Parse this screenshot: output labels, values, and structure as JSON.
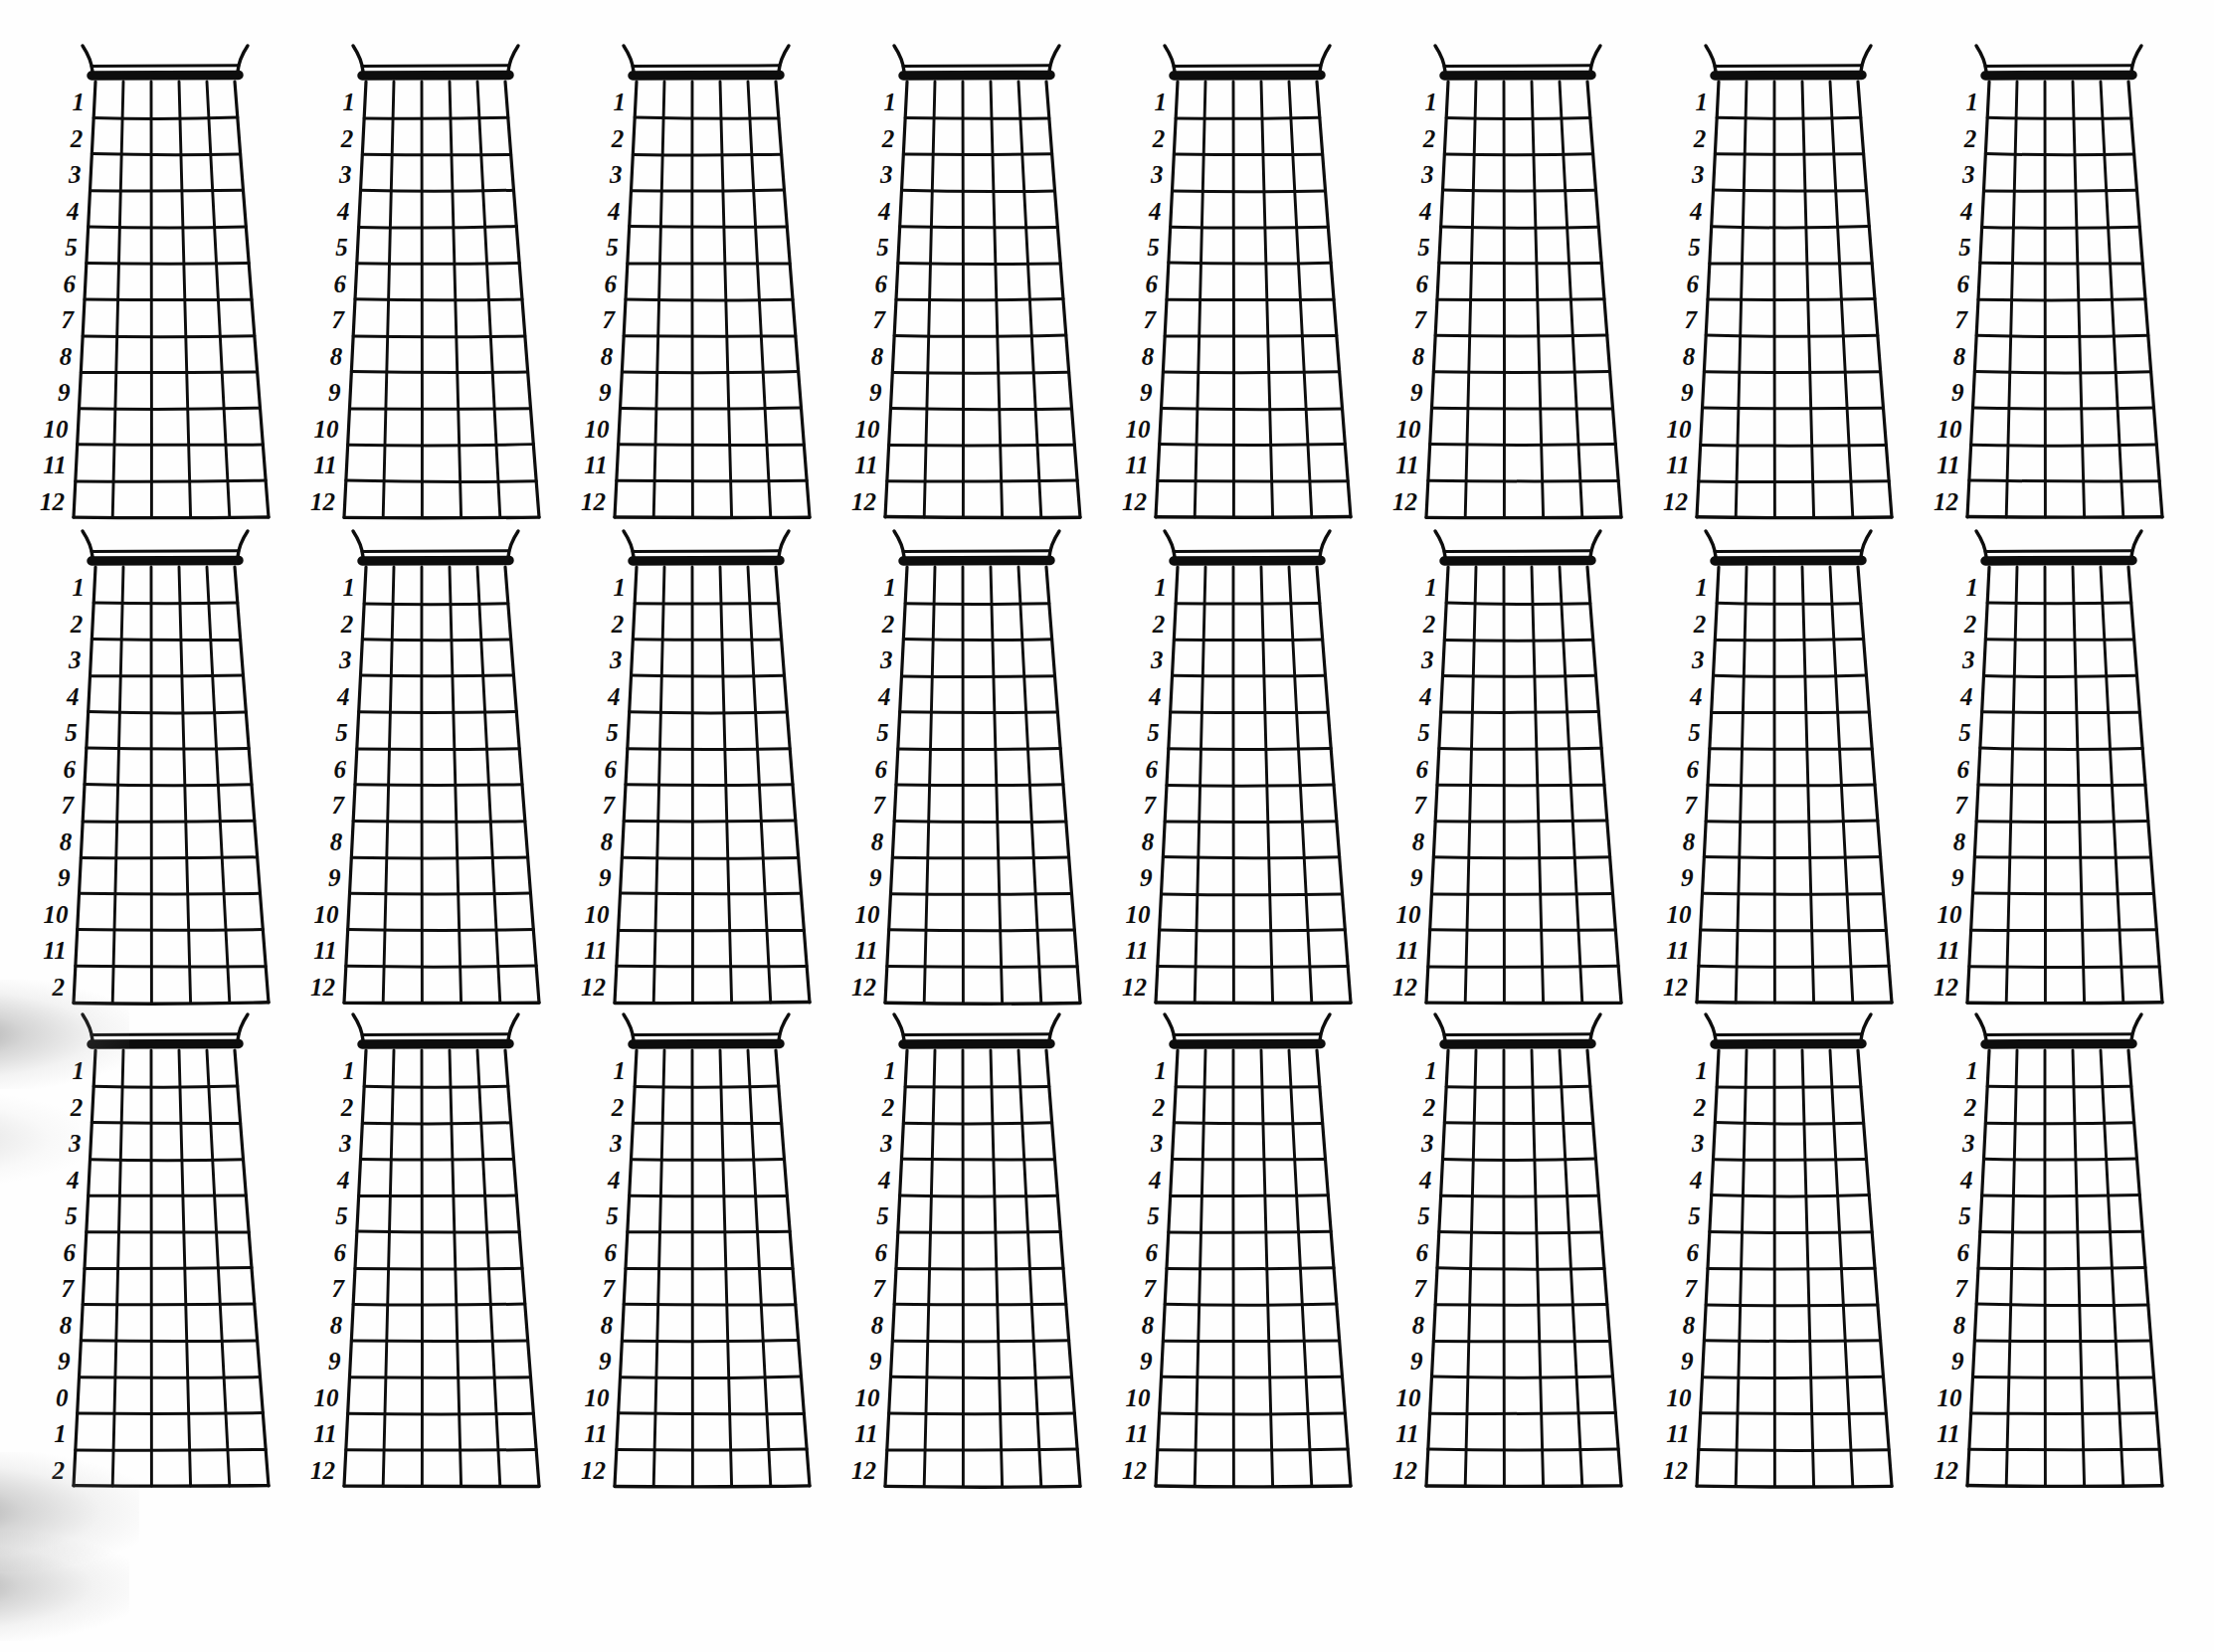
{
  "page": {
    "kind": "blank-guitar-fretboard-worksheet",
    "background_color": "#fefefe",
    "ink_color": "#0d0d0d",
    "rows": 3,
    "columns": 8,
    "diagram_count": 24
  },
  "diagram": {
    "name": "blank guitar neck diagram",
    "fret_count": 12,
    "string_count": 6,
    "cell_columns": 5,
    "nut_present": true,
    "headstock_curls": 2,
    "fret_numbers": [
      "1",
      "2",
      "3",
      "4",
      "5",
      "6",
      "7",
      "8",
      "9",
      "10",
      "11",
      "12"
    ]
  },
  "clipped_labels": {
    "row2_col1": [
      "1",
      "2",
      "3",
      "4",
      "5",
      "6",
      "7",
      "8",
      "9",
      "10",
      "11",
      "2"
    ],
    "row3_col1": [
      "1",
      "2",
      "3",
      "4",
      "5",
      "6",
      "7",
      "8",
      "9",
      "0",
      "1",
      "2"
    ]
  },
  "diagrams": [
    {
      "id": "r1c1",
      "row": 1,
      "col": 1,
      "labels_clipped": false
    },
    {
      "id": "r1c2",
      "row": 1,
      "col": 2,
      "labels_clipped": false
    },
    {
      "id": "r1c3",
      "row": 1,
      "col": 3,
      "labels_clipped": false
    },
    {
      "id": "r1c4",
      "row": 1,
      "col": 4,
      "labels_clipped": false
    },
    {
      "id": "r1c5",
      "row": 1,
      "col": 5,
      "labels_clipped": false
    },
    {
      "id": "r1c6",
      "row": 1,
      "col": 6,
      "labels_clipped": false
    },
    {
      "id": "r1c7",
      "row": 1,
      "col": 7,
      "labels_clipped": false
    },
    {
      "id": "r1c8",
      "row": 1,
      "col": 8,
      "labels_clipped": false
    },
    {
      "id": "r2c1",
      "row": 2,
      "col": 1,
      "labels_clipped": true
    },
    {
      "id": "r2c2",
      "row": 2,
      "col": 2,
      "labels_clipped": false
    },
    {
      "id": "r2c3",
      "row": 2,
      "col": 3,
      "labels_clipped": false
    },
    {
      "id": "r2c4",
      "row": 2,
      "col": 4,
      "labels_clipped": false
    },
    {
      "id": "r2c5",
      "row": 2,
      "col": 5,
      "labels_clipped": false
    },
    {
      "id": "r2c6",
      "row": 2,
      "col": 6,
      "labels_clipped": false
    },
    {
      "id": "r2c7",
      "row": 2,
      "col": 7,
      "labels_clipped": false
    },
    {
      "id": "r2c8",
      "row": 2,
      "col": 8,
      "labels_clipped": false
    },
    {
      "id": "r3c1",
      "row": 3,
      "col": 1,
      "labels_clipped": true
    },
    {
      "id": "r3c2",
      "row": 3,
      "col": 2,
      "labels_clipped": false
    },
    {
      "id": "r3c3",
      "row": 3,
      "col": 3,
      "labels_clipped": false
    },
    {
      "id": "r3c4",
      "row": 3,
      "col": 4,
      "labels_clipped": false
    },
    {
      "id": "r3c5",
      "row": 3,
      "col": 5,
      "labels_clipped": false
    },
    {
      "id": "r3c6",
      "row": 3,
      "col": 6,
      "labels_clipped": false
    },
    {
      "id": "r3c7",
      "row": 3,
      "col": 7,
      "labels_clipped": false
    },
    {
      "id": "r3c8",
      "row": 3,
      "col": 8,
      "labels_clipped": false
    }
  ]
}
